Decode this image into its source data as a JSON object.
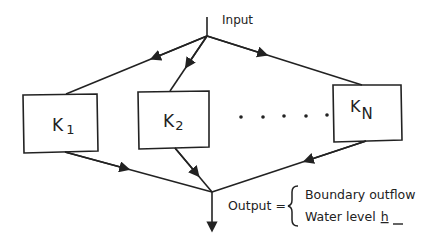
{
  "diagram": {
    "input_label": "Input",
    "boxes": [
      {
        "id": "K1",
        "main": "K",
        "sub": "1"
      },
      {
        "id": "K2",
        "main": "K",
        "sub": "2"
      },
      {
        "id": "KN",
        "main": "K",
        "sub": "N"
      }
    ],
    "ellipsis": "• • • • •",
    "output_label": "Output =",
    "outputs": [
      "Boundary outflow",
      "Water level"
    ],
    "water_level_var": "h",
    "colors": {
      "line": "#222222",
      "background": "#ffffff"
    }
  }
}
